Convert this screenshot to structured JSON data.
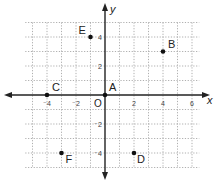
{
  "chart_data": {
    "type": "scatter",
    "title": "",
    "xlabel": "x",
    "ylabel": "y",
    "origin_label": "O",
    "xlim": [
      -5.5,
      6.5
    ],
    "ylim": [
      -5,
      5
    ],
    "grid": true,
    "grid_style": "dotted",
    "x_ticks": [
      {
        "value": -4,
        "label": "⁻4"
      },
      {
        "value": -2,
        "label": "⁻2"
      },
      {
        "value": 2,
        "label": "2"
      },
      {
        "value": 4,
        "label": "4"
      },
      {
        "value": 6,
        "label": "6"
      }
    ],
    "y_ticks": [
      {
        "value": 4,
        "label": "4"
      },
      {
        "value": 2,
        "label": "2"
      },
      {
        "value": -2,
        "label": "⁻2"
      },
      {
        "value": -4,
        "label": "⁻4"
      }
    ],
    "points": [
      {
        "label": "A",
        "x": 0,
        "y": 0
      },
      {
        "label": "B",
        "x": 4,
        "y": 3
      },
      {
        "label": "C",
        "x": -4,
        "y": 0
      },
      {
        "label": "D",
        "x": 2,
        "y": -4
      },
      {
        "label": "E",
        "x": -1,
        "y": 4
      },
      {
        "label": "F",
        "x": -3,
        "y": -4
      }
    ],
    "colors": {
      "axis": "#222222",
      "grid": "#9a9a9a",
      "point": "#111111"
    }
  }
}
